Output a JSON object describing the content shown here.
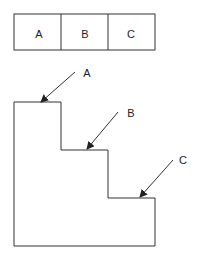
{
  "diagram": {
    "top_boxes": [
      {
        "label": "A"
      },
      {
        "label": "B"
      },
      {
        "label": "C"
      }
    ],
    "staircase": {
      "arrows": [
        {
          "label": "A"
        },
        {
          "label": "B"
        },
        {
          "label": "C"
        }
      ]
    },
    "colors": {
      "stroke": "#333333",
      "background": "#ffffff"
    }
  }
}
